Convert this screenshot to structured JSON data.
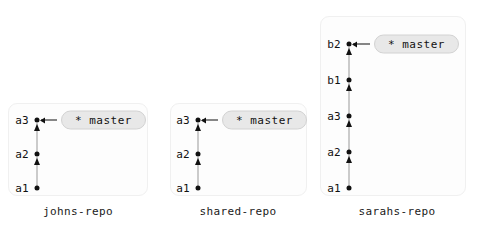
{
  "diagram": {
    "repos": [
      {
        "id": "johns-repo",
        "label": "johns-repo",
        "panel": {
          "left": 8,
          "top": 103,
          "width": 140,
          "height": 93
        },
        "label_x": 78,
        "label_y": 205,
        "node_x": 37,
        "commits": [
          {
            "id": "a3",
            "label": "a3",
            "y": 120
          },
          {
            "id": "a2",
            "label": "a2",
            "y": 154
          },
          {
            "id": "a1",
            "label": "a1",
            "y": 188
          }
        ],
        "branch": {
          "name": "master",
          "text": "* master",
          "target": "a3",
          "badge_left": 61,
          "connector_left": 41,
          "connector_width": 16,
          "y": 120
        }
      },
      {
        "id": "shared-repo",
        "label": "shared-repo",
        "panel": {
          "left": 170,
          "top": 103,
          "width": 137,
          "height": 93
        },
        "label_x": 238,
        "label_y": 205,
        "node_x": 198,
        "commits": [
          {
            "id": "a3",
            "label": "a3",
            "y": 120
          },
          {
            "id": "a2",
            "label": "a2",
            "y": 154
          },
          {
            "id": "a1",
            "label": "a1",
            "y": 188
          }
        ],
        "branch": {
          "name": "master",
          "text": "* master",
          "target": "a3",
          "badge_left": 222,
          "connector_left": 202,
          "connector_width": 16,
          "y": 120
        }
      },
      {
        "id": "sarahs-repo",
        "label": "sarahs-repo",
        "panel": {
          "left": 320,
          "top": 16,
          "width": 146,
          "height": 180
        },
        "label_x": 397,
        "label_y": 205,
        "node_x": 349,
        "commits": [
          {
            "id": "b2",
            "label": "b2",
            "y": 44
          },
          {
            "id": "b1",
            "label": "b1",
            "y": 80
          },
          {
            "id": "a3",
            "label": "a3",
            "y": 116
          },
          {
            "id": "a2",
            "label": "a2",
            "y": 152
          },
          {
            "id": "a1",
            "label": "a1",
            "y": 188
          }
        ],
        "branch": {
          "name": "master",
          "text": "* master",
          "target": "b2",
          "badge_left": 374,
          "connector_left": 353,
          "connector_width": 17,
          "y": 44
        }
      }
    ],
    "colors": {
      "node": "#111111",
      "edge": "#9a9a9a",
      "badge_fill": "#e8e8e8",
      "badge_border": "#d2d2d2",
      "panel_fill": "#fdfdfd",
      "panel_border": "#f0f0f0",
      "background": "#ffffff",
      "text": "#111111"
    }
  }
}
